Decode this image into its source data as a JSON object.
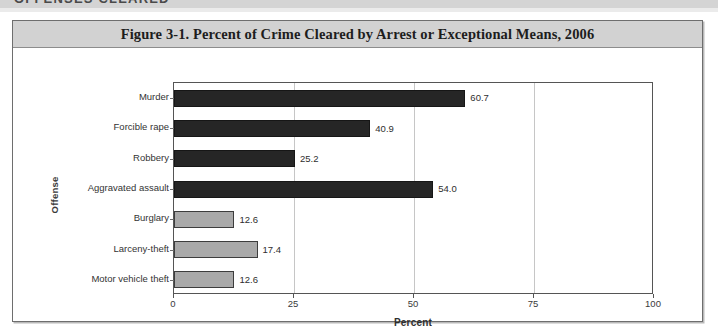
{
  "page": {
    "section_header": "OFFENSES CLEARED",
    "background_color": "#ffffff"
  },
  "figure": {
    "title": "Figure 3-1. Percent of Crime Cleared by Arrest or Exceptional Means, 2006",
    "title_band_color": "#d2d2d2",
    "frame_color": "#6e6e6e"
  },
  "chart_data": {
    "type": "bar",
    "orientation": "horizontal",
    "title": "Figure 3-1. Percent of Crime Cleared by Arrest or Exceptional Means, 2006",
    "subtitle": "",
    "xlabel": "Percent",
    "ylabel": "Offense",
    "xlim": [
      0,
      100
    ],
    "xticks": [
      0,
      25,
      50,
      75,
      100
    ],
    "xtick_labels": [
      "0",
      "25",
      "50",
      "75",
      "100"
    ],
    "grid": "vertical gridlines at 25, 50, 75",
    "legend": "none",
    "categories": [
      "Murder",
      "Forcible rape",
      "Robbery",
      "Aggravated assault",
      "Burglary",
      "Larceny-theft",
      "Motor vehicle theft"
    ],
    "values": [
      60.7,
      40.9,
      25.2,
      54.0,
      12.6,
      17.4,
      12.6
    ],
    "value_labels": [
      "60.7",
      "40.9",
      "25.2",
      "54.0",
      "12.6",
      "17.4",
      "12.6"
    ],
    "bar_colors": [
      "#262626",
      "#262626",
      "#262626",
      "#262626",
      "#a9a9a9",
      "#a9a9a9",
      "#a9a9a9"
    ],
    "series": [
      {
        "name": "Percent of crime cleared",
        "values": [
          60.7,
          40.9,
          25.2,
          54.0,
          12.6,
          17.4,
          12.6
        ]
      }
    ]
  }
}
